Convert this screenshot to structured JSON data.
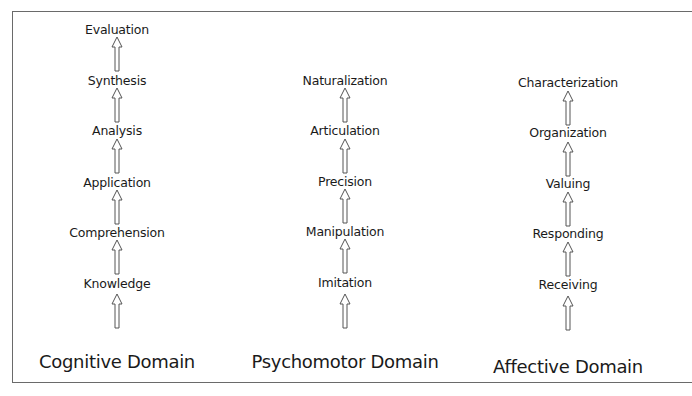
{
  "diagram": {
    "type": "hierarchy",
    "columns": [
      {
        "title": "Cognitive Domain",
        "levels_bottom_to_top": [
          "Knowledge",
          "Comprehension",
          "Application",
          "Analysis",
          "Synthesis",
          "Evaluation"
        ]
      },
      {
        "title": "Psychomotor Domain",
        "levels_bottom_to_top": [
          "Imitation",
          "Manipulation",
          "Precision",
          "Articulation",
          "Naturalization"
        ]
      },
      {
        "title": "Affective Domain",
        "levels_bottom_to_top": [
          "Receiving",
          "Responding",
          "Valuing",
          "Organization",
          "Characterization"
        ]
      }
    ],
    "arrow_icon": "hollow-up-arrow",
    "colors": {
      "text": "#1a1a1a",
      "arrow_stroke": "#555555",
      "frame": "#6a6a6a",
      "background": "#ffffff"
    }
  }
}
